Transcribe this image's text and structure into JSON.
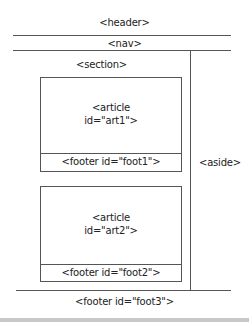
{
  "diagram": {
    "header": {
      "label": "<header>"
    },
    "nav": {
      "label": "<nav>"
    },
    "section": {
      "label": "<section>"
    },
    "articles": [
      {
        "label_line1": "<article",
        "label_line2": "id=\"art1\">",
        "footer": "<footer id=\"foot1\">"
      },
      {
        "label_line1": "<article",
        "label_line2": "id=\"art2\">",
        "footer": "<footer id=\"foot2\">"
      }
    ],
    "aside": {
      "label": "<aside>"
    },
    "page_footer": {
      "label": "<footer id=\"foot3\">"
    }
  }
}
